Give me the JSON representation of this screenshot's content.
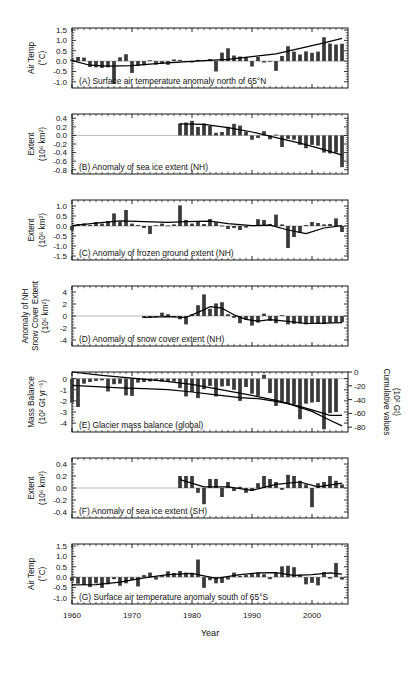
{
  "figure": {
    "xlabel": "Year",
    "x_ticks": [
      1960,
      1970,
      1980,
      1990,
      2000
    ],
    "x_range": [
      1960,
      2006
    ],
    "bar_color": "#3a3a3a",
    "line_color": "#000000",
    "axis_color": "#000000",
    "zero_line_color": "#9a9a9a"
  },
  "chart_data": [
    {
      "id": "A",
      "type": "bar",
      "title": "(A) Surface air temperature anomaly north of 65°N",
      "ylabel": "Air Temp",
      "yunit": "(°C)",
      "ylabel_full": "Air Temp (°C)",
      "ytick_labels": [
        "1.5",
        "1.0",
        "0.5",
        "0.0",
        "-0.5",
        "-1.0"
      ],
      "ytick_values": [
        1.5,
        1.0,
        0.5,
        0.0,
        -0.5,
        -1.0
      ],
      "ylim": [
        -1.3,
        1.6
      ],
      "xlabel": "",
      "grid": false,
      "has_smooth_line": true,
      "x": [
        1960,
        1961,
        1962,
        1963,
        1964,
        1965,
        1966,
        1967,
        1968,
        1969,
        1970,
        1971,
        1972,
        1973,
        1974,
        1975,
        1976,
        1977,
        1978,
        1979,
        1980,
        1981,
        1982,
        1983,
        1984,
        1985,
        1986,
        1987,
        1988,
        1989,
        1990,
        1991,
        1992,
        1993,
        1994,
        1995,
        1996,
        1997,
        1998,
        1999,
        2000,
        2001,
        2002,
        2003,
        2004,
        2005
      ],
      "values": [
        0.08,
        0.2,
        0.17,
        -0.28,
        -0.3,
        -0.33,
        -0.3,
        -1.1,
        0.18,
        0.33,
        -0.57,
        -0.23,
        -0.2,
        0.04,
        -0.17,
        -0.14,
        -0.18,
        0.08,
        0.06,
        -0.02,
        -0.07,
        0.06,
        0.05,
        0.1,
        -0.5,
        0.41,
        0.62,
        0.27,
        0.22,
        0.2,
        -0.26,
        0.2,
        -0.07,
        -0.03,
        -0.47,
        0.25,
        0.72,
        0.46,
        0.32,
        0.47,
        0.4,
        0.46,
        1.15,
        0.85,
        0.8,
        0.84,
        0.82,
        0.9,
        0.97,
        0.78,
        1.0,
        1.38,
        1.15
      ],
      "smooth": [
        [
          1960,
          0.02
        ],
        [
          1963,
          -0.2
        ],
        [
          1966,
          -0.24
        ],
        [
          1970,
          -0.22
        ],
        [
          1974,
          -0.12
        ],
        [
          1978,
          -0.05
        ],
        [
          1982,
          0.02
        ],
        [
          1986,
          0.08
        ],
        [
          1990,
          0.22
        ],
        [
          1994,
          0.35
        ],
        [
          1998,
          0.62
        ],
        [
          2002,
          0.88
        ],
        [
          2005,
          1.1
        ]
      ]
    },
    {
      "id": "B",
      "type": "bar",
      "title": "(B) Anomaly of sea ice extent (NH)",
      "ylabel": "Extent",
      "yunit": "(10⁶ km²)",
      "ylabel_full": "Extent (10⁶ km²)",
      "ytick_labels": [
        "0.4",
        "0.2",
        "0.0",
        "-0.2",
        "-0.4",
        "-0.6",
        "-0.8"
      ],
      "ytick_values": [
        0.4,
        0.2,
        0.0,
        -0.2,
        -0.4,
        -0.6,
        -0.8
      ],
      "ylim": [
        -0.9,
        0.5
      ],
      "xlabel": "",
      "grid": false,
      "has_smooth_line": true,
      "data_start_year": 1978,
      "x": [
        1978,
        1979,
        1980,
        1981,
        1982,
        1983,
        1984,
        1985,
        1986,
        1987,
        1988,
        1989,
        1990,
        1991,
        1992,
        1993,
        1994,
        1995,
        1996,
        1997,
        1998,
        1999,
        2000,
        2001,
        2002,
        2003,
        2004,
        2005
      ],
      "values": [
        0.28,
        0.3,
        0.34,
        0.2,
        0.28,
        0.22,
        0.06,
        0.08,
        0.2,
        0.27,
        0.23,
        0.09,
        -0.1,
        -0.06,
        0.1,
        -0.09,
        0.02,
        -0.27,
        -0.08,
        -0.1,
        -0.22,
        -0.3,
        -0.22,
        -0.24,
        -0.4,
        -0.42,
        -0.4,
        -0.74
      ],
      "smooth": [
        [
          1978,
          0.27
        ],
        [
          1982,
          0.26
        ],
        [
          1986,
          0.18
        ],
        [
          1990,
          0.08
        ],
        [
          1994,
          -0.05
        ],
        [
          1998,
          -0.18
        ],
        [
          2002,
          -0.33
        ],
        [
          2005,
          -0.46
        ]
      ]
    },
    {
      "id": "C",
      "type": "bar",
      "title": "(C) Anomaly of frozen ground extent (NH)",
      "ylabel": "Extent",
      "yunit": "(10⁶ km²)",
      "ylabel_full": "Extent (10⁶ km²)",
      "ytick_labels": [
        "1.0",
        "0.5",
        "0.0",
        "-0.5",
        "-1.0",
        "-1.5"
      ],
      "ytick_values": [
        1.0,
        0.5,
        0.0,
        -0.5,
        -1.0,
        -1.5
      ],
      "ylim": [
        -1.7,
        1.3
      ],
      "xlabel": "",
      "grid": false,
      "has_smooth_line": true,
      "x": [
        1960,
        1961,
        1962,
        1963,
        1964,
        1965,
        1966,
        1967,
        1968,
        1969,
        1970,
        1971,
        1972,
        1973,
        1974,
        1975,
        1976,
        1977,
        1978,
        1979,
        1980,
        1981,
        1982,
        1983,
        1984,
        1985,
        1986,
        1987,
        1988,
        1989,
        1990,
        1991,
        1992,
        1993,
        1994,
        1995,
        1996,
        1997,
        1998,
        1999,
        2000,
        2001,
        2002,
        2003,
        2004,
        2005
      ],
      "values": [
        -0.22,
        0.1,
        0.13,
        0.05,
        0.2,
        0.12,
        0.25,
        0.63,
        0.2,
        0.8,
        0.12,
        0.05,
        -0.1,
        -0.4,
        0.04,
        0.12,
        0.03,
        0.08,
        1.03,
        0.3,
        0.12,
        0.25,
        0.1,
        0.35,
        0.18,
        0.02,
        -0.15,
        -0.1,
        -0.2,
        -0.08,
        0.05,
        0.34,
        0.3,
        0.1,
        0.57,
        0.08,
        -1.1,
        -0.55,
        -0.35,
        0.05,
        0.2,
        0.15,
        0.08,
        0.1,
        0.38,
        -0.3
      ],
      "smooth": [
        [
          1960,
          0.02
        ],
        [
          1964,
          0.14
        ],
        [
          1968,
          0.26
        ],
        [
          1972,
          0.22
        ],
        [
          1976,
          0.18
        ],
        [
          1979,
          0.22
        ],
        [
          1983,
          0.24
        ],
        [
          1986,
          0.12
        ],
        [
          1990,
          0.02
        ],
        [
          1993,
          0.04
        ],
        [
          1996,
          -0.2
        ],
        [
          1999,
          -0.38
        ],
        [
          2002,
          -0.1
        ],
        [
          2005,
          0.02
        ]
      ]
    },
    {
      "id": "D",
      "type": "bar",
      "title": "(D) Anomaly of snow cover extent (NH)",
      "ylabel": "Anomaly of NH Snow Cover Extent",
      "yunit": "(10⁶ km²)",
      "ylabel_full": "Anomaly of NH Snow Cover Extent (10⁶ km²)",
      "ytick_labels": [
        "4",
        "2",
        "0",
        "-2",
        "-4"
      ],
      "ytick_values": [
        4,
        2,
        0,
        -2,
        -4
      ],
      "ylim": [
        -5,
        5
      ],
      "xlabel": "",
      "grid": false,
      "has_smooth_line": true,
      "data_start_year": 1972,
      "x": [
        1972,
        1973,
        1974,
        1975,
        1976,
        1977,
        1978,
        1979,
        1980,
        1981,
        1982,
        1983,
        1984,
        1985,
        1986,
        1987,
        1988,
        1989,
        1990,
        1991,
        1992,
        1993,
        1994,
        1995,
        1996,
        1997,
        1998,
        1999,
        2000,
        2001,
        2002,
        2003,
        2004,
        2005
      ],
      "values": [
        -0.35,
        -0.25,
        -0.2,
        0.55,
        0.3,
        -0.2,
        -0.55,
        -1.4,
        0.3,
        1.8,
        3.6,
        1.2,
        2.1,
        2.3,
        0.3,
        -0.3,
        -1.2,
        -0.6,
        -1.6,
        -1.1,
        0.4,
        -0.8,
        -1.2,
        0.15,
        -1.4,
        -1.3,
        -1.25,
        -1.4,
        -1.2,
        -1.3,
        -1.35,
        -1.1,
        -1.0,
        -1.05
      ],
      "smooth": [
        [
          1972,
          -0.22
        ],
        [
          1976,
          -0.12
        ],
        [
          1979,
          -0.25
        ],
        [
          1981,
          0.6
        ],
        [
          1983,
          1.55
        ],
        [
          1985,
          1.3
        ],
        [
          1987,
          0.2
        ],
        [
          1989,
          -0.55
        ],
        [
          1991,
          -0.85
        ],
        [
          1993,
          -0.6
        ],
        [
          1996,
          -0.9
        ],
        [
          1999,
          -1.25
        ],
        [
          2002,
          -1.2
        ],
        [
          2005,
          -1.1
        ]
      ]
    },
    {
      "id": "E",
      "type": "bar",
      "title": "(E) Glacier mass balance (global)",
      "ylabel": "Mass Balance",
      "yunit": "(10² Gt yr⁻¹)",
      "ylabel_full": "Mass Balance (10² Gt yr⁻¹)",
      "ytick_labels": [
        "0",
        "-1",
        "-2",
        "-3",
        "-4"
      ],
      "ytick_values": [
        0,
        -1,
        -2,
        -3,
        -4
      ],
      "ylim": [
        -4.8,
        0.6
      ],
      "right_axis": {
        "label": "Cumulative values",
        "unit": "(10² Gt)",
        "label_full": "Cumulative values (10² Gt)",
        "ytick_labels": [
          "0",
          "-20",
          "-40",
          "-60",
          "-80"
        ],
        "ytick_values": [
          0,
          -20,
          -40,
          -60,
          -80
        ]
      },
      "xlabel": "",
      "grid": false,
      "has_smooth_line": true,
      "x": [
        1960,
        1961,
        1962,
        1963,
        1964,
        1965,
        1966,
        1967,
        1968,
        1969,
        1970,
        1971,
        1972,
        1973,
        1974,
        1975,
        1976,
        1977,
        1978,
        1979,
        1980,
        1981,
        1982,
        1983,
        1984,
        1985,
        1986,
        1987,
        1988,
        1989,
        1990,
        1991,
        1992,
        1993,
        1994,
        1995,
        1996,
        1997,
        1998,
        1999,
        2000,
        2001,
        2002,
        2003,
        2004,
        2005
      ],
      "values": [
        -2.15,
        -2.55,
        -0.45,
        -0.3,
        -0.2,
        -0.15,
        -1.15,
        -0.5,
        -0.45,
        -1.5,
        -1.55,
        -0.35,
        -0.3,
        -0.25,
        -0.2,
        -0.25,
        -0.3,
        -0.25,
        -0.85,
        -1.6,
        -1.2,
        -1.75,
        -0.95,
        -0.65,
        -1.6,
        -0.7,
        -0.65,
        -1.0,
        -2.0,
        -0.75,
        -1.35,
        -1.55,
        0.35,
        -1.3,
        -2.45,
        -2.0,
        -2.2,
        -2.3,
        -3.65,
        -2.25,
        -2.15,
        -2.1,
        -4.55,
        -3.1,
        -3.0
      ],
      "smooth": [
        [
          1960,
          -0.6
        ],
        [
          1964,
          -0.72
        ],
        [
          1968,
          -0.82
        ],
        [
          1972,
          -0.9
        ],
        [
          1976,
          -0.98
        ],
        [
          1980,
          -1.2
        ],
        [
          1984,
          -1.45
        ],
        [
          1988,
          -1.7
        ],
        [
          1991,
          -1.8
        ],
        [
          1994,
          -2.05
        ],
        [
          1997,
          -2.35
        ],
        [
          2000,
          -2.8
        ],
        [
          2003,
          -3.3
        ],
        [
          2005,
          -3.3
        ]
      ],
      "cumulative_line": [
        [
          1960,
          0
        ],
        [
          1965,
          -5
        ],
        [
          1970,
          -9
        ],
        [
          1975,
          -13
        ],
        [
          1980,
          -18
        ],
        [
          1985,
          -26
        ],
        [
          1990,
          -34
        ],
        [
          1995,
          -43
        ],
        [
          2000,
          -57
        ],
        [
          2003,
          -70
        ],
        [
          2005,
          -78
        ]
      ]
    },
    {
      "id": "F",
      "type": "bar",
      "title": "(F) Anomaly of sea ice extent (SH)",
      "ylabel": "Extent",
      "yunit": "(10⁶ km²)",
      "ylabel_full": "Extent (10⁶ km²)",
      "ytick_labels": [
        "0.4",
        "0.2",
        "0.0",
        "-0.2",
        "-0.4"
      ],
      "ytick_values": [
        0.4,
        0.2,
        0.0,
        -0.2,
        -0.4
      ],
      "ylim": [
        -0.5,
        0.5
      ],
      "xlabel": "",
      "grid": false,
      "has_smooth_line": true,
      "data_start_year": 1978,
      "x": [
        1978,
        1979,
        1980,
        1981,
        1982,
        1983,
        1984,
        1985,
        1986,
        1987,
        1988,
        1989,
        1990,
        1991,
        1992,
        1993,
        1994,
        1995,
        1996,
        1997,
        1998,
        1999,
        2000,
        2001,
        2002,
        2003,
        2004,
        2005
      ],
      "values": [
        0.2,
        0.2,
        0.2,
        -0.08,
        -0.27,
        0.15,
        0.15,
        -0.15,
        0.1,
        -0.05,
        0.02,
        -0.08,
        -0.05,
        0.08,
        0.2,
        0.15,
        0.1,
        -0.03,
        0.22,
        0.2,
        0.12,
        0.06,
        -0.32,
        0.08,
        0.1,
        0.2,
        0.12,
        0.06
      ],
      "smooth": [
        [
          1978,
          0.14
        ],
        [
          1982,
          0.02
        ],
        [
          1986,
          0.02
        ],
        [
          1990,
          -0.04
        ],
        [
          1994,
          0.06
        ],
        [
          1998,
          0.1
        ],
        [
          2001,
          0.02
        ],
        [
          2005,
          0.08
        ]
      ]
    },
    {
      "id": "G",
      "type": "bar",
      "title": "(G) Surface air temperature anomaly south of 65°S",
      "ylabel": "Air Temp",
      "yunit": "(°C)",
      "ylabel_full": "Air Temp (°C)",
      "ytick_labels": [
        "1.5",
        "1.0",
        "0.5",
        "0.0",
        "-0.5",
        "-1.0"
      ],
      "ytick_values": [
        1.5,
        1.0,
        0.5,
        0.0,
        -0.5,
        -1.0
      ],
      "ylim": [
        -1.3,
        1.6
      ],
      "xlabel": "Year",
      "grid": false,
      "has_smooth_line": true,
      "x": [
        1960,
        1961,
        1962,
        1963,
        1964,
        1965,
        1966,
        1967,
        1968,
        1969,
        1970,
        1971,
        1972,
        1973,
        1974,
        1975,
        1976,
        1977,
        1978,
        1979,
        1980,
        1981,
        1982,
        1983,
        1984,
        1985,
        1986,
        1987,
        1988,
        1989,
        1990,
        1991,
        1992,
        1993,
        1994,
        1995,
        1996,
        1997,
        1998,
        1999,
        2000,
        2001,
        2002,
        2003,
        2004,
        2005
      ],
      "values": [
        -0.18,
        -0.32,
        -0.38,
        -0.48,
        -0.3,
        -0.52,
        -0.35,
        -0.1,
        -0.42,
        -0.3,
        -0.14,
        -0.45,
        0.1,
        0.22,
        -0.12,
        0.05,
        0.28,
        0.2,
        0.3,
        0.22,
        0.18,
        0.85,
        -0.52,
        -0.15,
        -0.3,
        -0.28,
        -0.12,
        0.22,
        0.06,
        0.1,
        0.18,
        0.22,
        0.14,
        -0.1,
        0.2,
        0.52,
        0.55,
        0.48,
        0.12,
        -0.35,
        -0.28,
        -0.4,
        0.25,
        -0.08,
        0.68,
        -0.12,
        -0.32,
        0.06,
        0.3,
        0.35,
        0.28,
        0.24,
        0.1
      ],
      "smooth": [
        [
          1960,
          -0.38
        ],
        [
          1964,
          -0.36
        ],
        [
          1968,
          -0.24
        ],
        [
          1972,
          -0.04
        ],
        [
          1976,
          0.12
        ],
        [
          1980,
          0.18
        ],
        [
          1984,
          -0.06
        ],
        [
          1988,
          0.12
        ],
        [
          1991,
          0.2
        ],
        [
          1994,
          0.22
        ],
        [
          1997,
          0.08
        ],
        [
          2000,
          0.12
        ],
        [
          2003,
          0.2
        ],
        [
          2005,
          0.14
        ]
      ]
    }
  ]
}
